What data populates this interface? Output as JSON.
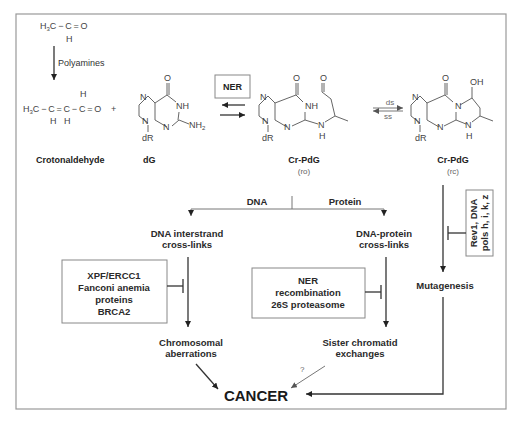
{
  "diagram": {
    "top_row": {
      "acetaldehyde": {
        "formula_left": "H",
        "formula_sub": "3",
        "formula_right": "C − C = O",
        "h_label": "H"
      },
      "polyamines_label": "Polyamines",
      "crotonaldehyde": {
        "left": "H",
        "sub": "3",
        "right": "C − C = C − C = O",
        "h_top": "H",
        "h_bottom_1": "H",
        "h_bottom_2": "H",
        "name": "Crotonaldehyde"
      },
      "plus": "+",
      "dG": {
        "O": "O",
        "N7": "N",
        "NH": "NH",
        "N9": "N",
        "N3": "N",
        "NH2": "NH",
        "NH2_sub": "2",
        "dR": "dR",
        "name": "dG"
      },
      "ner_box": "NER",
      "cr_pdg_ro": {
        "O": "O",
        "O2": "O",
        "NH": "NH",
        "N": "N",
        "N2": "N",
        "N3": "N",
        "NH_link": "N",
        "H": "H",
        "dR": "dR",
        "name": "Cr-PdG",
        "form": "(ro)"
      },
      "equilibrium": {
        "top": "ds",
        "bottom": "ss"
      },
      "cr_pdg_rc": {
        "O": "O",
        "OH": "OH",
        "N": "N",
        "N2": "N",
        "N3": "N",
        "N4": "N",
        "NH_link": "N",
        "H": "H",
        "dR": "dR",
        "name": "Cr-PdG",
        "form": "(rc)"
      }
    },
    "branch": {
      "left": "DNA",
      "right": "Protein"
    },
    "nodes": {
      "interstrand": [
        "DNA interstrand",
        "cross-links"
      ],
      "dpc": [
        "DNA-protein",
        "cross-links"
      ],
      "mutagenesis": "Mutagenesis",
      "chromosomal": [
        "Chromosomal",
        "aberrations"
      ],
      "sister": [
        "Sister chromatid",
        "exchanges"
      ],
      "cancer": "CANCER",
      "question": "?"
    },
    "repair_boxes": {
      "icl_repair": [
        "XPF/ERCC1",
        "Fanconi anemia",
        "proteins",
        "BRCA2"
      ],
      "dpc_repair": [
        "NER",
        "recombination",
        "26S proteasome"
      ],
      "tls": [
        "Rev1, DNA",
        "pols h, i, k, z"
      ]
    }
  }
}
